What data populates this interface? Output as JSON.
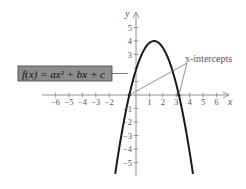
{
  "chart_data": {
    "type": "line",
    "title": "",
    "xlabel": "x",
    "ylabel": "y",
    "xlim": [
      -6.5,
      6.7
    ],
    "ylim": [
      -6,
      6
    ],
    "x_ticks": [
      -6,
      -5,
      -4,
      -3,
      -2,
      1,
      2,
      3,
      4,
      5,
      6
    ],
    "x_tick_labels": [
      "−6",
      "−5",
      "−4",
      "−3",
      "−2",
      "1",
      "2",
      "3",
      "4",
      "5",
      "6"
    ],
    "y_ticks": [
      5,
      4,
      3,
      2,
      1,
      -1,
      -2,
      -3,
      -4,
      -5
    ],
    "y_tick_labels": [
      "5",
      "4",
      "3",
      "",
      "",
      "−1",
      "−2",
      "−3",
      "−4",
      "−5"
    ],
    "grid": false,
    "series": [
      {
        "name": "f(x) = ax² + bx + c",
        "kind": "parabola",
        "vertex": [
          1.35,
          4
        ],
        "x_intercepts": [
          -0.5,
          3.2
        ],
        "y_intercept": 2.85,
        "a": -1.17,
        "opens": "down"
      }
    ],
    "annotations": [
      {
        "text": "x-intercepts",
        "points_to": [
          [
            -0.5,
            0
          ],
          [
            3.2,
            0
          ]
        ]
      },
      {
        "text": "f(x) = ax² + bx + c",
        "boxed": true,
        "points_to_curve": true
      }
    ]
  },
  "labels": {
    "function_box": "f(x) = ax² + bx + c",
    "intercepts": "x-intercepts",
    "x_axis": "x",
    "y_axis": "y"
  },
  "colors": {
    "curve": "#1a1a1a",
    "axis": "#777777",
    "box_fill": "#8c8c8c",
    "box_border": "#444444",
    "text": "#555555"
  }
}
